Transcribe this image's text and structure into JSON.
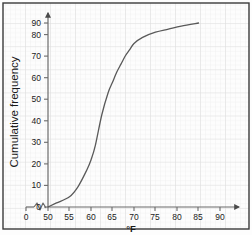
{
  "chart_data": {
    "type": "line",
    "title": "",
    "subtitle": "",
    "xlabel": "°F",
    "ylabel": "Cumulative frequency",
    "xlim": [
      50,
      90
    ],
    "ylim": [
      0,
      90
    ],
    "xticks": [
      0,
      50,
      55,
      60,
      65,
      70,
      75,
      80,
      85,
      90
    ],
    "xtick_labels": [
      "0",
      "50",
      "55",
      "60",
      "65",
      "70",
      "75",
      "80",
      "85",
      "90"
    ],
    "yticks": [
      0,
      10,
      20,
      30,
      40,
      50,
      60,
      70,
      80,
      90
    ],
    "ytick_labels": [
      "0",
      "10",
      "20",
      "30",
      "40",
      "50",
      "60",
      "70",
      "80",
      "90"
    ],
    "axis_break": {
      "present": true,
      "axis": "x",
      "symbol": "zigzag",
      "between": [
        0,
        50
      ]
    },
    "grid": "graph-paper minor and major",
    "legend": "none",
    "axis_arrows": [
      "x-right",
      "y-up"
    ],
    "series": [
      {
        "name": "Cumulative frequency",
        "color": "#595959",
        "x": [
          50,
          52,
          55,
          57,
          59,
          60,
          61,
          62.5,
          64,
          65,
          66,
          67,
          68,
          69,
          70,
          72,
          75,
          78,
          81,
          85
        ],
        "values": [
          0,
          2,
          5,
          10,
          18,
          23,
          30,
          45,
          56,
          61,
          66,
          70,
          74,
          77,
          80,
          83,
          85.5,
          87,
          88.5,
          90
        ]
      }
    ]
  },
  "axis_labels": {
    "x_unit": "°F",
    "y_title": "Cumulative frequency"
  },
  "tick_text": {
    "x": [
      "0",
      "50",
      "55",
      "60",
      "65",
      "70",
      "75",
      "80",
      "85",
      "90"
    ],
    "y": [
      "0",
      "10",
      "20",
      "30",
      "40",
      "50",
      "60",
      "70",
      "80",
      "90"
    ]
  },
  "colors": {
    "curve": "#595959",
    "axis": "#6b6b6b",
    "grid_minor": "#ececec",
    "grid_major": "#dedede",
    "text": "#1a1a1a",
    "background": "#fdfdfd",
    "border": "#3a3a3a"
  }
}
